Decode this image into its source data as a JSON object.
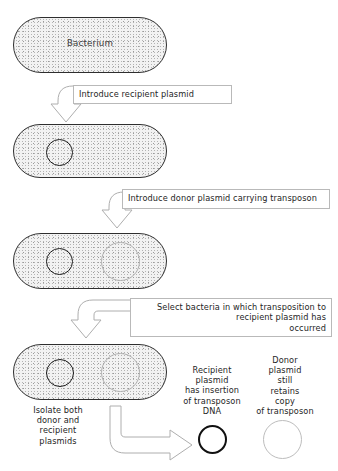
{
  "diagram": {
    "colors": {
      "cell_fill": "#f2f2f2",
      "cell_stroke": "#2e2e2e",
      "recipient_plasmid": "#171717",
      "donor_plasmid": "#b0b0b0",
      "arrow_stroke": "#aeaeae",
      "box_stroke": "#b9b9b9",
      "text": "#262626"
    }
  },
  "steps": {
    "step1": {
      "cell_label": "Bacterium",
      "arrow_label": "Introduce recipient plasmid"
    },
    "step2": {
      "arrow_label": "Introduce donor plasmid carrying transposon"
    },
    "step3": {
      "arrow_label_line1": "Select bacteria in which  transposition to",
      "arrow_label_line2": "recipient  plasmid has",
      "arrow_label_line3": "occurred"
    },
    "step4": {
      "arrow_label_line1": "Isolate both",
      "arrow_label_line2": "donor and",
      "arrow_label_line3": "recipient",
      "arrow_label_line4": "plasmids"
    }
  },
  "results": {
    "recipient": {
      "line1": "Recipient",
      "line2": "plasmid",
      "line3": "has insertion",
      "line4": "of transposon",
      "line5": "DNA"
    },
    "donor": {
      "line1": "Donor",
      "line2": "plasmid",
      "line3": "still",
      "line4": "retains",
      "line5": "copy",
      "line6": "of transposon"
    }
  }
}
